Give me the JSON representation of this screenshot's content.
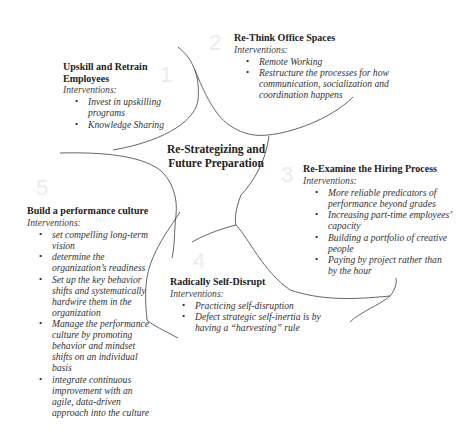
{
  "center": {
    "title_line1": "Re-Strategizing and",
    "title_line2": "Future Preparation"
  },
  "section_numbers": [
    "1",
    "2",
    "3",
    "4",
    "5"
  ],
  "sections": [
    {
      "number": "1",
      "title": "Upskill and Retrain Employees",
      "subtitle": "Interventions:",
      "items": [
        "Invest in upskilling programs",
        "Knowledge Sharing"
      ]
    },
    {
      "number": "2",
      "title": "Re-Think Office Spaces",
      "subtitle": "Interventions:",
      "items": [
        "Remote Working",
        "Restructure the processes for how communication, socialization and coordination happens"
      ]
    },
    {
      "number": "3",
      "title": "Re-Examine the Hiring Process",
      "subtitle": "Interventions:",
      "items": [
        "More reliable predicators of performance beyond grades",
        "Increasing part-time employees’ capacity",
        "Building a portfolio of creative people",
        "Paying by project rather than by the hour"
      ]
    },
    {
      "number": "4",
      "title": "Radically Self-Disrupt",
      "subtitle": "Interventions:",
      "items": [
        "Practicing self-disruption",
        "Defect strategic self-inertia is by having a “harvesting” rule"
      ]
    },
    {
      "number": "5",
      "title": "Build a performance culture",
      "subtitle": "Interventions:",
      "items": [
        "set compelling long-term vision",
        "determine the organization’s readiness",
        "Set up the key behavior shifts and systematically hardwire them in the organization",
        "Manage the performance culture by promoting behavior and mindset shifts on an individual basis",
        "integrate continuous improvement with an agile, data-driven approach into the culture"
      ]
    }
  ],
  "colors": {
    "line": "#555555",
    "text": "#222222",
    "number_watermark": "#ececec"
  }
}
